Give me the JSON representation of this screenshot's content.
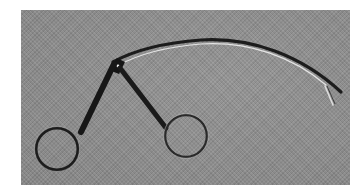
{
  "image": {
    "subject": "Curved surgical forceps with ring handles",
    "alt": "Stainless steel curved grasping forceps with two finger rings, lying on a gray textured cloth",
    "background_color": "#8e8e8e",
    "instrument_color": "#1e1e1e",
    "highlight_color": "#e6e6e6"
  }
}
